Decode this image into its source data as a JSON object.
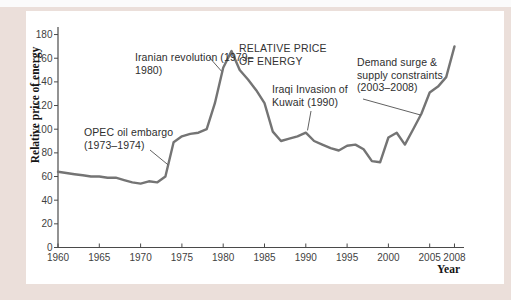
{
  "window": {
    "background_color": "#ebdfda",
    "panel_color": "#ffffff",
    "top_strip_color": "#fbfbfb"
  },
  "chart_data": {
    "type": "line",
    "title": "RELATIVE PRICE OF ENERGY",
    "xlabel": "Year",
    "ylabel": "Relative price of energy",
    "x_ticks": [
      1960,
      1965,
      1970,
      1975,
      1980,
      1985,
      1990,
      1995,
      2000,
      2005,
      2008
    ],
    "y_ticks": [
      0,
      20,
      40,
      60,
      80,
      100,
      120,
      140,
      160,
      180
    ],
    "xlim": [
      1960,
      2009
    ],
    "ylim": [
      0,
      186
    ],
    "grid": false,
    "legend_position": "none",
    "line_color": "#747474",
    "axis_color": "#4a4a4a",
    "series": [
      {
        "name": "Relative price of energy",
        "x": [
          1960,
          1961,
          1962,
          1963,
          1964,
          1965,
          1966,
          1967,
          1968,
          1969,
          1970,
          1971,
          1972,
          1973,
          1974,
          1975,
          1976,
          1977,
          1978,
          1979,
          1980,
          1981,
          1982,
          1983,
          1984,
          1985,
          1986,
          1987,
          1988,
          1989,
          1990,
          1991,
          1992,
          1993,
          1994,
          1995,
          1996,
          1997,
          1998,
          1999,
          2000,
          2001,
          2002,
          2003,
          2004,
          2005,
          2006,
          2007,
          2008
        ],
        "y": [
          64,
          63,
          62,
          61,
          60,
          60,
          59,
          59,
          57,
          55,
          54,
          56,
          55,
          60,
          89,
          94,
          96,
          97,
          100,
          122,
          152,
          166,
          150,
          142,
          133,
          122,
          98,
          90,
          92,
          94,
          97,
          90,
          87,
          84,
          82,
          86,
          87,
          83,
          73,
          72,
          93,
          97,
          87,
          100,
          113,
          131,
          136,
          144,
          170
        ]
      }
    ],
    "annotations": [
      {
        "text": "OPEC oil embargo (1973–1974)",
        "target_year": 1973.3,
        "target_value": 70
      },
      {
        "text": "Iranian revolution (1979–1980)",
        "target_year": 1979.8,
        "target_value": 149
      },
      {
        "text": "Iraqi Invasion of Kuwait (1990)",
        "target_year": 1990.2,
        "target_value": 99
      },
      {
        "text": "Demand surge & supply constraints (2003–2008)",
        "target_year": 2003.9,
        "target_value": 112
      }
    ]
  }
}
